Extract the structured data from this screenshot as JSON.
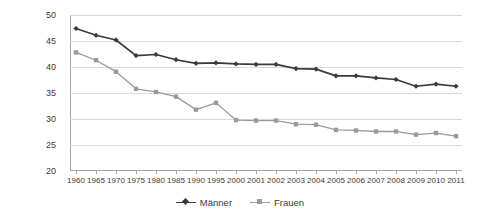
{
  "chart_data": {
    "type": "line",
    "title": "",
    "subtitle": "",
    "xlabel": "",
    "ylabel": "",
    "ylim": [
      20,
      50
    ],
    "yticks": [
      20,
      25,
      30,
      35,
      40,
      45,
      50
    ],
    "grid": true,
    "legend_position": "bottom",
    "categories": [
      "1960",
      "1965",
      "1970",
      "1975",
      "1980",
      "1985",
      "1990",
      "1995",
      "2000",
      "2001",
      "2002",
      "2003",
      "2004",
      "2005",
      "2006",
      "2007",
      "2008",
      "2009",
      "2010",
      "2011"
    ],
    "series": [
      {
        "name": "Männer",
        "color": "#3a3a3a",
        "marker": "diamond",
        "values": [
          47.4,
          46.1,
          45.2,
          42.2,
          42.4,
          41.4,
          40.7,
          40.8,
          40.6,
          40.5,
          40.5,
          39.7,
          39.6,
          38.3,
          38.3,
          37.9,
          37.6,
          36.3,
          36.7,
          36.3
        ]
      },
      {
        "name": "Frauen",
        "color": "#9a9a9a",
        "marker": "square",
        "values": [
          42.8,
          41.3,
          39.1,
          35.8,
          35.2,
          34.3,
          31.8,
          33.1,
          29.8,
          29.7,
          29.7,
          29.0,
          28.9,
          27.9,
          27.8,
          27.6,
          27.6,
          27.0,
          27.3,
          26.7
        ]
      }
    ]
  },
  "legend": {
    "items": [
      {
        "label": "Männer"
      },
      {
        "label": "Frauen"
      }
    ]
  },
  "axis": {
    "y_tick_labels": [
      "50",
      "45",
      "40",
      "35",
      "30",
      "25",
      "20"
    ],
    "x_tick_labels": [
      "1960",
      "1965",
      "1970",
      "1975",
      "1980",
      "1985",
      "1990",
      "1995",
      "2000",
      "2001",
      "2002",
      "2003",
      "2004",
      "2005",
      "2006",
      "2007",
      "2008",
      "2009",
      "2010",
      "2011"
    ]
  },
  "colors": {
    "series_maenner": "#3a3a3a",
    "series_frauen": "#9a9a9a",
    "gridline": "#d9d9d9",
    "axis": "#a6a6a6",
    "background": "#ffffff"
  }
}
